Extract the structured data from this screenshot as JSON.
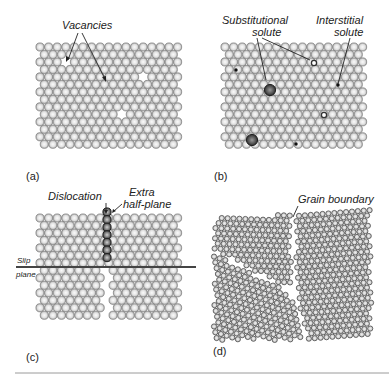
{
  "figure": {
    "panels": [
      {
        "id": "a",
        "label": "(a)",
        "title": "Vacancies",
        "annotations": [
          {
            "text": "Vacancies"
          }
        ]
      },
      {
        "id": "b",
        "label": "(b)",
        "annotations": [
          {
            "text_line1": "Substitutional",
            "text_line2": "solute"
          },
          {
            "text_line1": "Interstitial",
            "text_line2": "solute"
          }
        ]
      },
      {
        "id": "c",
        "label": "(c)",
        "annotations": [
          {
            "text": "Dislocation"
          },
          {
            "text_line1": "Extra",
            "text_line2": "half-plane"
          },
          {
            "text_line1": "Slip",
            "text_line2": "plane"
          }
        ]
      },
      {
        "id": "d",
        "label": "(d)",
        "annotations": [
          {
            "text": "Grain boundary"
          }
        ]
      }
    ],
    "colors": {
      "atom_fill_light": "#f4f4f4",
      "atom_fill_mid": "#bdbdbd",
      "atom_stroke": "#6e6e6e",
      "solute_dark": "#3a3a3a",
      "grain_atom_fill": "#d6d6d6",
      "grain_atom_stroke": "#4a4a4a",
      "divider": "#9a9a9a"
    }
  }
}
